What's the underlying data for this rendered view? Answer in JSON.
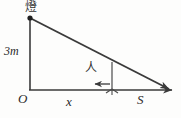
{
  "figure": {
    "type": "geometry-diagram",
    "background_color": "#fdfdfc",
    "stroke_color": "#3a3a3a",
    "labels": {
      "lamp": "燈",
      "pole_height": "3m",
      "person": "人",
      "origin": "O",
      "distance_x": "x",
      "shadow_s": "S"
    },
    "geometry": {
      "lamp_top": [
        30,
        18
      ],
      "origin": [
        30,
        90
      ],
      "axis_end": [
        176,
        90
      ],
      "hypotenuse_end": [
        172,
        90
      ],
      "person_foot": [
        112,
        90
      ],
      "person_head": [
        112,
        62
      ],
      "arrow_tail": [
        110,
        84
      ],
      "arrow_head": [
        93,
        84
      ]
    }
  }
}
